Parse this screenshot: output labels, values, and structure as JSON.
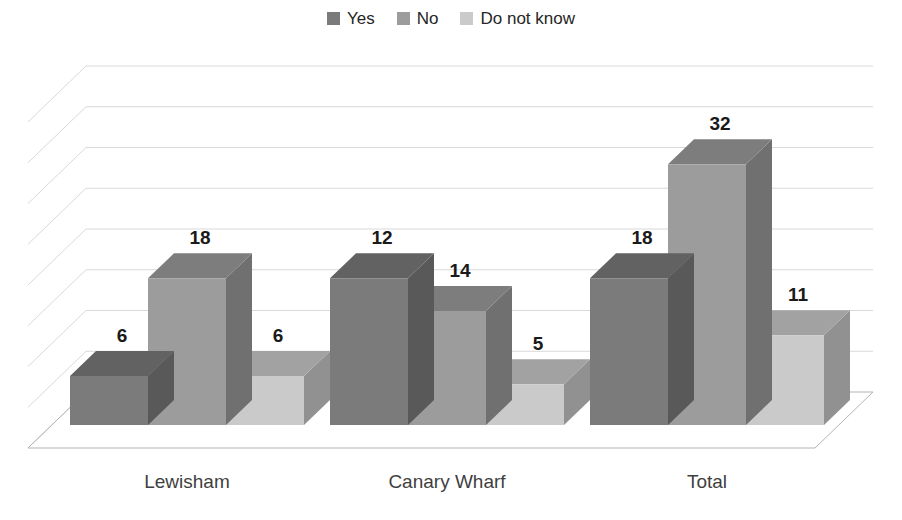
{
  "legend": {
    "position": "top-center",
    "items": [
      {
        "label": "Yes",
        "color": "#7b7b7b",
        "icon": "legend-square-icon"
      },
      {
        "label": "No",
        "color": "#9c9c9c",
        "icon": "legend-square-icon"
      },
      {
        "label": "Do not know",
        "color": "#cacaca",
        "icon": "legend-square-icon"
      }
    ]
  },
  "chart_data": {
    "type": "bar",
    "title": "",
    "subtitle": "",
    "xlabel": "",
    "ylabel": "",
    "categories": [
      "Lewisham",
      "Canary Wharf",
      "Total"
    ],
    "series": [
      {
        "name": "Yes",
        "color": "#7b7b7b",
        "values": [
          6,
          18,
          18
        ]
      },
      {
        "name": "No",
        "color": "#9c9c9c",
        "values": [
          18,
          14,
          32
        ]
      },
      {
        "name": "Do not know",
        "color": "#cacaca",
        "values": [
          6,
          5,
          11
        ]
      }
    ],
    "data_labels": [
      [
        "6",
        "18",
        "6"
      ],
      [
        "12",
        "14",
        "5"
      ],
      [
        "18",
        "32",
        "11"
      ]
    ],
    "ylim": [
      0,
      40
    ],
    "ytick_interval": 5,
    "gridlines": 8,
    "grid": true,
    "axis_tick_labels_shown": false,
    "three_d": true,
    "legend_position": "top-center",
    "palette": "grayscale"
  }
}
